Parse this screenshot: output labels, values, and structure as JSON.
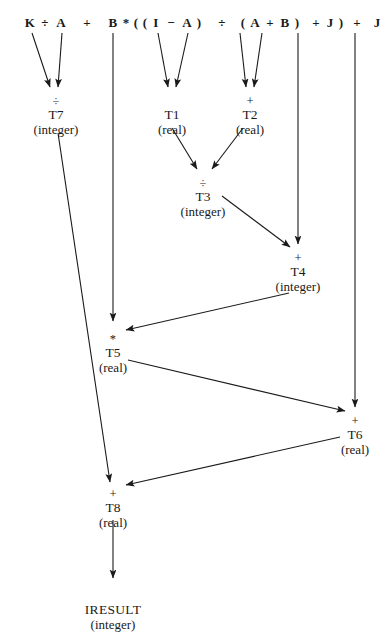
{
  "diagram": {
    "expression_tokens": [
      {
        "text": "K",
        "x": 30,
        "y": 16
      },
      {
        "text": "÷",
        "x": 45,
        "y": 16
      },
      {
        "text": "A",
        "x": 61,
        "y": 16
      },
      {
        "text": "+",
        "x": 87,
        "y": 16
      },
      {
        "text": "B",
        "x": 113,
        "y": 16
      },
      {
        "text": "*",
        "x": 126,
        "y": 16
      },
      {
        "text": "(",
        "x": 136,
        "y": 16
      },
      {
        "text": "(",
        "x": 145,
        "y": 16
      },
      {
        "text": "I",
        "x": 156,
        "y": 16
      },
      {
        "text": "−",
        "x": 171,
        "y": 16
      },
      {
        "text": "A",
        "x": 187,
        "y": 16
      },
      {
        "text": ")",
        "x": 199,
        "y": 16
      },
      {
        "text": "÷",
        "x": 222,
        "y": 16
      },
      {
        "text": "(",
        "x": 243,
        "y": 16
      },
      {
        "text": "A",
        "x": 255,
        "y": 16
      },
      {
        "text": "+",
        "x": 270,
        "y": 16
      },
      {
        "text": "B",
        "x": 285,
        "y": 16
      },
      {
        "text": ")",
        "x": 297,
        "y": 16
      },
      {
        "text": "+",
        "x": 316,
        "y": 16
      },
      {
        "text": "J",
        "x": 330,
        "y": 16
      },
      {
        "text": ")",
        "x": 341,
        "y": 16
      },
      {
        "text": "+",
        "x": 357,
        "y": 16
      },
      {
        "text": "J",
        "x": 377,
        "y": 16
      }
    ],
    "expression_text": "K ÷ A + B*((I − A) ÷ (A + B) + J) + J",
    "nodes": [
      {
        "id": "T7",
        "op": "÷",
        "name": "T7",
        "type": "(integer)",
        "x": 56,
        "y": 96
      },
      {
        "id": "T1",
        "op": "",
        "name": "T1",
        "type": "(real)",
        "x": 172,
        "y": 96
      },
      {
        "id": "T2",
        "op": "+",
        "name": "T2",
        "type": "(real)",
        "x": 250,
        "y": 96
      },
      {
        "id": "T3",
        "op": "÷",
        "name": "T3",
        "type": "(integer)",
        "x": 203,
        "y": 178
      },
      {
        "id": "T4",
        "op": "+",
        "name": "T4",
        "type": "(integer)",
        "x": 298,
        "y": 253
      },
      {
        "id": "T5",
        "op": "*",
        "name": "T5",
        "type": "(real)",
        "x": 113,
        "y": 334
      },
      {
        "id": "T6",
        "op": "+",
        "name": "T6",
        "type": "(real)",
        "x": 355,
        "y": 416
      },
      {
        "id": "T8",
        "op": "+",
        "name": "T8",
        "type": "(real)",
        "x": 113,
        "y": 489
      },
      {
        "id": "IRESULT",
        "op": "",
        "name": "IRESULT",
        "type": "(integer)",
        "x": 113,
        "y": 591,
        "leaf": true
      }
    ],
    "edges": [
      {
        "from": "K",
        "to": "T7",
        "path": "M 32 33 L 50 87",
        "arrow": true
      },
      {
        "from": "A",
        "to": "T7",
        "path": "M 62 33 L 58 87",
        "arrow": true
      },
      {
        "from": "B",
        "to": "T5",
        "path": "M 113 33 L 113 321",
        "arrow": true
      },
      {
        "from": "I",
        "to": "T1",
        "path": "M 158 33 L 168 87",
        "arrow": true
      },
      {
        "from": "A2",
        "to": "T1",
        "path": "M 188 33 L 176 87",
        "arrow": true
      },
      {
        "from": "A3",
        "to": "T2",
        "path": "M 240 33 L 246 87",
        "arrow": true
      },
      {
        "from": "B2",
        "to": "T2",
        "path": "M 262 33 L 254 87",
        "arrow": true
      },
      {
        "from": "J1",
        "to": "T4",
        "path": "M 298 33 L 298 244",
        "arrow": true
      },
      {
        "from": "J2",
        "to": "T6",
        "path": "M 355 33 L 355 407",
        "arrow": true
      },
      {
        "from": "T1",
        "to": "T3",
        "path": "M 172 128 L 197 169",
        "arrow": true
      },
      {
        "from": "T2",
        "to": "T3",
        "path": "M 243 128 L 212 169",
        "arrow": true
      },
      {
        "from": "T3",
        "to": "T4",
        "path": "M 222 196 L 290 247",
        "arrow": true
      },
      {
        "from": "T4",
        "to": "T5",
        "path": "M 289 293 L 126 330",
        "arrow": true
      },
      {
        "from": "T5",
        "to": "T6",
        "path": "M 128 360 L 345 411",
        "arrow": true
      },
      {
        "from": "T7",
        "to": "T8",
        "path": "M 58 133 L 110 482",
        "arrow": true
      },
      {
        "from": "T6",
        "to": "T8",
        "path": "M 340 437 L 126 485",
        "arrow": true
      },
      {
        "from": "T8",
        "to": "IRESULT",
        "path": "M 113 520 L 113 578",
        "arrow": true
      }
    ]
  }
}
